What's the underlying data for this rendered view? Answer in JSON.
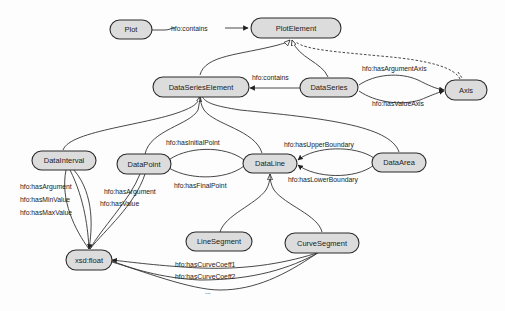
{
  "diagram": {
    "type": "ontology-class-diagram",
    "nodes": {
      "plot": {
        "label": "Plot"
      },
      "plot_element": {
        "label": "PlotElement"
      },
      "data_series_element": {
        "label": "DataSeriesElement"
      },
      "data_series": {
        "label": "DataSeries"
      },
      "axis": {
        "label": "Axis"
      },
      "data_interval": {
        "label": "DataInterval"
      },
      "data_point": {
        "label": "DataPoint"
      },
      "data_line": {
        "label": "DataLine"
      },
      "data_area": {
        "label": "DataArea"
      },
      "xsd_float": {
        "label": "xsd:float"
      },
      "line_segment": {
        "label": "LineSegment"
      },
      "curve_segment": {
        "label": "CurveSegment"
      }
    },
    "edge_labels": {
      "plot_contains": "hfo:contains",
      "series_contains": "hfo:contains",
      "has_argument_axis": "hfo:hasArgumentAxis",
      "has_value_axis": "hfo:hasValueAxis",
      "has_initial_point": "hfo:hasInitialPoint",
      "has_final_point": "hfo:hasFinalPoint",
      "has_upper_boundary": "hfo:hasUpperBoundary",
      "has_lower_boundary": "hfo:hasLowerBoundary",
      "interval_has_argument": "hfo:hasArgument",
      "interval_has_min_value": "hfo:hasMinValue",
      "interval_has_max_value": "hfo:hasMaxValue",
      "point_has_argument": "hfo:hasArgument",
      "point_has_value": "hfo:hasValue",
      "has_curve_coeff1": "hfo:hasCurveCoeff1",
      "has_curve_coeff2": "hfo:hasCurveCoeff2",
      "ellipsis": "..."
    },
    "edges": [
      {
        "from": "Plot",
        "to": "PlotElement",
        "label": "hfo:contains",
        "kind": "property"
      },
      {
        "from": "DataSeriesElement",
        "to": "PlotElement",
        "kind": "subclass"
      },
      {
        "from": "DataSeries",
        "to": "PlotElement",
        "kind": "subclass"
      },
      {
        "from": "Axis",
        "to": "PlotElement",
        "kind": "subclass-dashed"
      },
      {
        "from": "DataSeries",
        "to": "DataSeriesElement",
        "label": "hfo:contains",
        "kind": "property"
      },
      {
        "from": "DataSeries",
        "to": "Axis",
        "label": "hfo:hasArgumentAxis",
        "kind": "property"
      },
      {
        "from": "DataSeries",
        "to": "Axis",
        "label": "hfo:hasValueAxis",
        "kind": "property"
      },
      {
        "from": "DataInterval",
        "to": "DataSeriesElement",
        "kind": "subclass"
      },
      {
        "from": "DataPoint",
        "to": "DataSeriesElement",
        "kind": "subclass"
      },
      {
        "from": "DataLine",
        "to": "DataSeriesElement",
        "kind": "subclass"
      },
      {
        "from": "DataArea",
        "to": "DataSeriesElement",
        "kind": "subclass"
      },
      {
        "from": "DataLine",
        "to": "DataPoint",
        "label": "hfo:hasInitialPoint",
        "kind": "property"
      },
      {
        "from": "DataLine",
        "to": "DataPoint",
        "label": "hfo:hasFinalPoint",
        "kind": "property"
      },
      {
        "from": "DataArea",
        "to": "DataLine",
        "label": "hfo:hasUpperBoundary",
        "kind": "property"
      },
      {
        "from": "DataArea",
        "to": "DataLine",
        "label": "hfo:hasLowerBoundary",
        "kind": "property"
      },
      {
        "from": "LineSegment",
        "to": "DataLine",
        "kind": "subclass"
      },
      {
        "from": "CurveSegment",
        "to": "DataLine",
        "kind": "subclass"
      },
      {
        "from": "DataInterval",
        "to": "xsd:float",
        "label": "hfo:hasArgument",
        "kind": "property"
      },
      {
        "from": "DataInterval",
        "to": "xsd:float",
        "label": "hfo:hasMinValue",
        "kind": "property"
      },
      {
        "from": "DataInterval",
        "to": "xsd:float",
        "label": "hfo:hasMaxValue",
        "kind": "property"
      },
      {
        "from": "DataPoint",
        "to": "xsd:float",
        "label": "hfo:hasArgument",
        "kind": "property"
      },
      {
        "from": "DataPoint",
        "to": "xsd:float",
        "label": "hfo:hasValue",
        "kind": "property"
      },
      {
        "from": "CurveSegment",
        "to": "xsd:float",
        "label": "hfo:hasCurveCoeff1",
        "kind": "property"
      },
      {
        "from": "CurveSegment",
        "to": "xsd:float",
        "label": "hfo:hasCurveCoeff2",
        "kind": "property"
      },
      {
        "from": "CurveSegment",
        "to": "xsd:float",
        "label": "...",
        "kind": "property"
      }
    ]
  },
  "colors": {
    "node_fill": "#dcdcdc",
    "node_stroke": "#2b2b2b",
    "edge": "#333333",
    "background": "#fdfdfd"
  }
}
